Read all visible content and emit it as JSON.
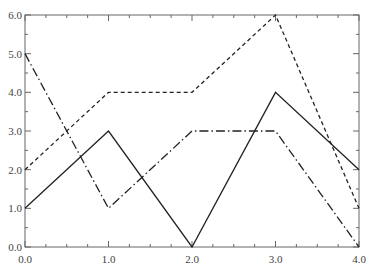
{
  "chart_data": {
    "type": "line",
    "title": "",
    "xlabel": "",
    "ylabel": "",
    "x": [
      0,
      1,
      2,
      3,
      4
    ],
    "xlim": [
      0,
      4
    ],
    "ylim": [
      0,
      6
    ],
    "x_ticks": [
      "0.0",
      "1.0",
      "2.0",
      "3.0",
      "4.0"
    ],
    "y_ticks": [
      "0.0",
      "1.0",
      "2.0",
      "3.0",
      "4.0",
      "5.0",
      "6.0"
    ],
    "grid": false,
    "legend": null,
    "series": [
      {
        "name": "solid",
        "style": "solid",
        "color": "#222222",
        "values": [
          1,
          3,
          0,
          4,
          2
        ]
      },
      {
        "name": "dashed",
        "style": "dashed",
        "color": "#222222",
        "values": [
          2,
          4,
          4,
          6,
          1
        ]
      },
      {
        "name": "dash-dot",
        "style": "dashdot",
        "color": "#222222",
        "values": [
          5,
          1,
          3,
          3,
          0
        ]
      }
    ]
  }
}
